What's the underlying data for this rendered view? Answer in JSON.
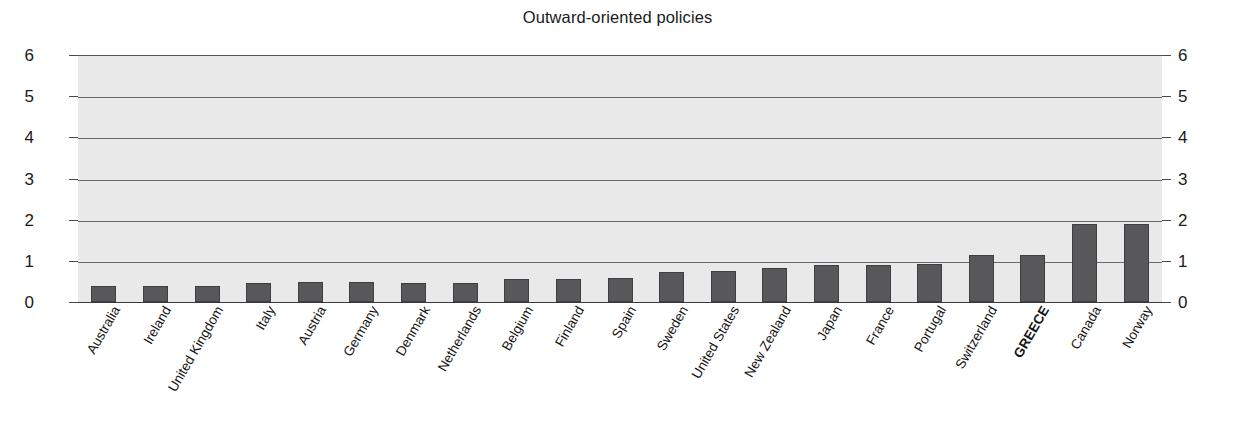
{
  "chart_data": {
    "type": "bar",
    "title": "Outward-oriented policies",
    "xlabel": "",
    "ylabel": "",
    "ylim": [
      0,
      6
    ],
    "yticks": [
      0,
      1,
      2,
      3,
      4,
      5,
      6
    ],
    "ytick_labels": [
      "0",
      "1",
      "2",
      "3",
      "4",
      "5",
      "6"
    ],
    "grid": true,
    "legend": "none",
    "dual_axis": true,
    "axis_right_labels": [
      "0",
      "1",
      "2",
      "3",
      "4",
      "5",
      "6"
    ],
    "highlight_category": "GREECE",
    "bar_color": "#58585a",
    "plot_background": "#e9e9e9",
    "categories": [
      "Australia",
      "Ireland",
      "United Kingdom",
      "Italy",
      "Austria",
      "Germany",
      "Denmark",
      "Netherlands",
      "Belgium",
      "Finland",
      "Spain",
      "Sweden",
      "United States",
      "New Zealand",
      "Japan",
      "France",
      "Portugal",
      "Switzerland",
      "GREECE",
      "Canada",
      "Norway"
    ],
    "values": [
      0.4,
      0.4,
      0.4,
      0.45,
      0.48,
      0.48,
      0.47,
      0.47,
      0.55,
      0.55,
      0.58,
      0.72,
      0.75,
      0.82,
      0.9,
      0.9,
      0.92,
      1.15,
      1.15,
      1.9,
      1.9
    ]
  }
}
